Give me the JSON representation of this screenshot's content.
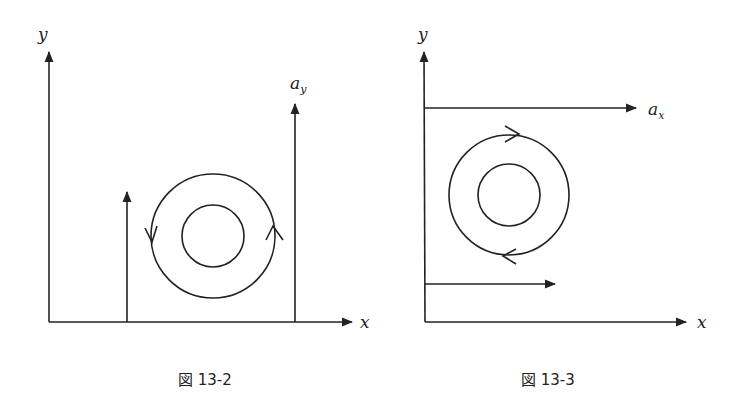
{
  "figures": [
    {
      "caption": "図 13-2",
      "axis_labels": {
        "y": "y",
        "x": "x"
      },
      "vector_label": {
        "base": "a",
        "sub": "y"
      },
      "description": "Vertical vector field a_y increasing with x; circulation loop counterclockwise"
    },
    {
      "caption": "図 13-3",
      "axis_labels": {
        "y": "y",
        "x": "x"
      },
      "vector_label": {
        "base": "a",
        "sub": "x"
      },
      "description": "Horizontal vector field a_x increasing with y; circulation loop clockwise"
    }
  ],
  "colors": {
    "stroke": "#222222",
    "background": "#ffffff"
  }
}
